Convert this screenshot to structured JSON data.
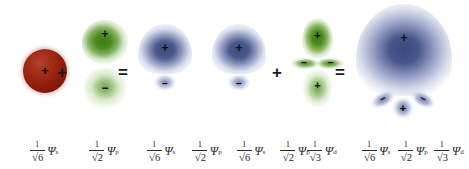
{
  "figure": {
    "background": "#ffffff",
    "colors": {
      "s_orbital_red": "#9a2212",
      "p_orbital_green": "#4d8c1f",
      "d_orbital_green": "#4d8c1f",
      "hybrid_blue": "#3d4c80",
      "sign_black": "#111111",
      "text": "#2b2b2b"
    }
  },
  "operators": {
    "plus": "+",
    "equals": "="
  },
  "signs": {
    "positive": "+",
    "negative": "−"
  },
  "equation_operators": [
    {
      "symbol": "+",
      "x": 61
    },
    {
      "symbol": "=",
      "x": 122
    },
    {
      "symbol": "+",
      "x": 276
    },
    {
      "symbol": "=",
      "x": 339
    }
  ],
  "orbitals": [
    {
      "id": "s-orbital",
      "name": "s orbital",
      "color": "red",
      "shape": "sphere",
      "lobes": [
        {
          "sign": "+"
        }
      ]
    },
    {
      "id": "p-orbital",
      "name": "p orbital",
      "color": "green",
      "shape": "dumbbell",
      "lobes": [
        {
          "sign": "+"
        },
        {
          "sign": "−"
        }
      ]
    },
    {
      "id": "hybrid-sp-1",
      "name": "sp hybrid orbital",
      "color": "blue",
      "shape": "dome-with-small-lobe",
      "lobes": [
        {
          "sign": "+"
        },
        {
          "sign": "−"
        }
      ]
    },
    {
      "id": "hybrid-sp-2",
      "name": "sp hybrid orbital",
      "color": "blue",
      "shape": "dome-with-small-lobe",
      "lobes": [
        {
          "sign": "+"
        },
        {
          "sign": "−"
        }
      ]
    },
    {
      "id": "d-orbital",
      "name": "d orbital",
      "color": "green",
      "shape": "dz2",
      "lobes": [
        {
          "sign": "+"
        },
        {
          "sign": "−"
        },
        {
          "sign": "−"
        },
        {
          "sign": "+"
        }
      ]
    },
    {
      "id": "hybrid-spd",
      "name": "spd hybrid orbital",
      "color": "blue",
      "shape": "large-dome-with-three-lobes",
      "lobes": [
        {
          "sign": "+"
        },
        {
          "sign": "−"
        },
        {
          "sign": "+"
        },
        {
          "sign": "−"
        }
      ]
    }
  ],
  "formulas": [
    {
      "id": "formula-s",
      "numerator": "1",
      "radicand": "6",
      "psi": "Ψ",
      "subscript": "s",
      "text": "1/√6 Ψs",
      "x": 18,
      "width": 52
    },
    {
      "id": "formula-p",
      "numerator": "1",
      "radicand": "2",
      "psi": "Ψ",
      "subscript": "p",
      "text": "1/√2 Ψp",
      "x": 78,
      "width": 52
    },
    {
      "id": "formula-hybrid1-s",
      "numerator": "1",
      "radicand": "6",
      "psi": "Ψ",
      "subscript": "s",
      "text": "1/√6 Ψs",
      "x": 138,
      "width": 46
    },
    {
      "id": "formula-hybrid1-p",
      "numerator": "1",
      "radicand": "2",
      "psi": "Ψ",
      "subscript": "p",
      "text": "1/√2 Ψp",
      "x": 184,
      "width": 46
    },
    {
      "id": "formula-hybrid2-s",
      "numerator": "1",
      "radicand": "6",
      "psi": "Ψ",
      "subscript": "s",
      "text": "1/√6 Ψs",
      "x": 228,
      "width": 46
    },
    {
      "id": "formula-hybrid2-p",
      "numerator": "1",
      "radicand": "2",
      "psi": "Ψ",
      "subscript": "p",
      "text": "1/√2 Ψp",
      "x": 272,
      "width": 46
    },
    {
      "id": "formula-d",
      "numerator": "1",
      "radicand": "3",
      "psi": "Ψ",
      "subscript": "d",
      "text": "1/√3 Ψd",
      "x": 296,
      "width": 52
    },
    {
      "id": "formula-result-s",
      "numerator": "1",
      "radicand": "6",
      "psi": "Ψ",
      "subscript": "s",
      "text": "1/√6 Ψs",
      "x": 355,
      "width": 42
    },
    {
      "id": "formula-result-p",
      "numerator": "1",
      "radicand": "2",
      "psi": "Ψ",
      "subscript": "p",
      "text": "1/√2 Ψp",
      "x": 392,
      "width": 42
    },
    {
      "id": "formula-result-d",
      "numerator": "1",
      "radicand": "3",
      "psi": "Ψ",
      "subscript": "d",
      "text": "1/√3 Ψd",
      "x": 428,
      "width": 42
    }
  ]
}
